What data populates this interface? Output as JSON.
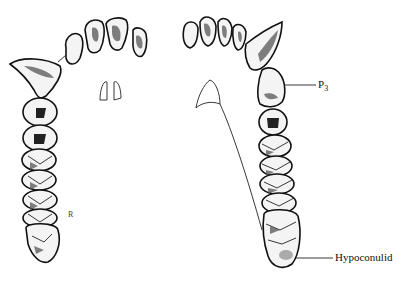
{
  "figure": {
    "labels": {
      "p3": {
        "main": "P",
        "sub": "3"
      },
      "hypoconulid": "Hypoconulid",
      "small_mark": "R"
    }
  }
}
